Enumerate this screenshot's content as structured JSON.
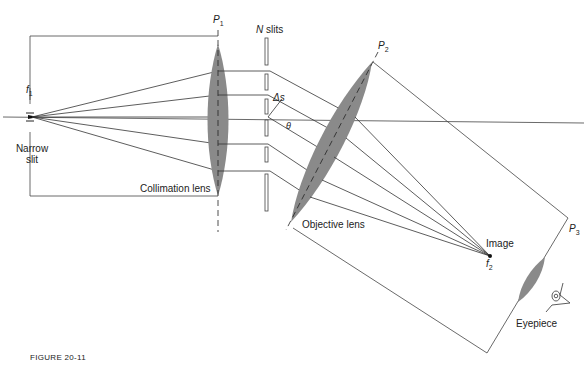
{
  "figure": {
    "caption": "FIGURE 20-11"
  },
  "labels": {
    "source_focus": {
      "symbol": "f",
      "subscript": "1"
    },
    "narrow_slit": {
      "line1": "Narrow",
      "line2": "slit"
    },
    "collimation_plane": {
      "symbol": "P",
      "subscript": "1"
    },
    "collimation_lens": "Collimation lens",
    "n_slits": {
      "symbol": "N",
      "text": "slits"
    },
    "slit_spacing": "Δs",
    "angle": "θ",
    "objective_plane": {
      "symbol": "P",
      "subscript": "2"
    },
    "objective_lens": "Objective lens",
    "image": "Image",
    "image_focus": {
      "symbol": "f",
      "subscript": "2"
    },
    "eyepiece_plane": {
      "symbol": "P",
      "subscript": "3"
    },
    "eyepiece": "Eyepiece"
  },
  "colors": {
    "line": "#333333",
    "lens_fill": "#8a8a8a",
    "background": "#ffffff"
  }
}
